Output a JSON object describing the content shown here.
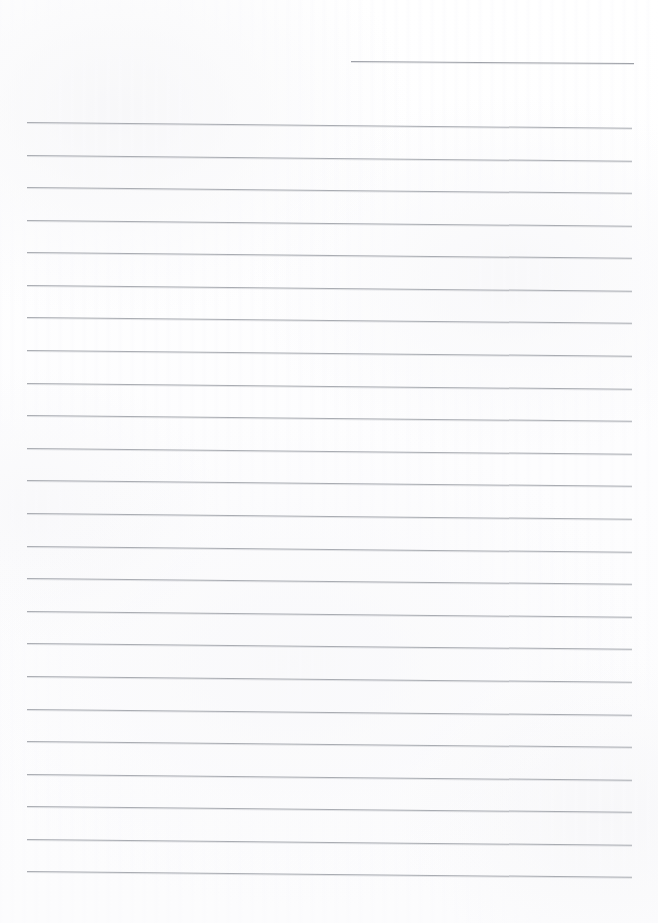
{
  "document": {
    "kind": "scanned-lined-notebook-paper",
    "title": "Blank Ruled Paper Scan",
    "page_width": 658,
    "page_height": 923,
    "visible_text": "",
    "content_note": "No handwriting, no printed text, no headings, no page numbers — the page is blank apart from the ruled guide lines."
  },
  "colors": {
    "page_background": "#fdfdfd",
    "paper_tone": "#fcfcfd",
    "rule_line": "#a9acb2",
    "rule_line_dark": "#9ea1a8",
    "rule_line_soft_edge": "rgba(170,173,180,0.30)"
  },
  "ruling": {
    "line_count": 25,
    "spacing_px": 32.5,
    "stroke_width_px": 1,
    "full_line_left_px": 27,
    "full_line_right_px": 632,
    "full_line_length_px": 605,
    "tilt_deg": 0.55,
    "first_line_is_partial": true,
    "partial_line_left_px": 351,
    "partial_line_right_px": 634,
    "partial_line_length_px": 283,
    "lines": [
      {
        "index": 1,
        "y": 61,
        "left": 351,
        "width": 283,
        "partial": true,
        "tilt": 0.42
      },
      {
        "index": 2,
        "y": 122,
        "left": 27,
        "width": 605,
        "partial": false,
        "tilt": 0.55
      },
      {
        "index": 3,
        "y": 155,
        "left": 27,
        "width": 605,
        "partial": false,
        "tilt": 0.55
      },
      {
        "index": 4,
        "y": 187,
        "left": 27,
        "width": 605,
        "partial": false,
        "tilt": 0.55
      },
      {
        "index": 5,
        "y": 220,
        "left": 27,
        "width": 605,
        "partial": false,
        "tilt": 0.55
      },
      {
        "index": 6,
        "y": 252,
        "left": 27,
        "width": 605,
        "partial": false,
        "tilt": 0.55
      },
      {
        "index": 7,
        "y": 285,
        "left": 27,
        "width": 605,
        "partial": false,
        "tilt": 0.55
      },
      {
        "index": 8,
        "y": 317,
        "left": 27,
        "width": 605,
        "partial": false,
        "tilt": 0.55
      },
      {
        "index": 9,
        "y": 350,
        "left": 27,
        "width": 605,
        "partial": false,
        "tilt": 0.55
      },
      {
        "index": 10,
        "y": 383,
        "left": 27,
        "width": 605,
        "partial": false,
        "tilt": 0.55
      },
      {
        "index": 11,
        "y": 415,
        "left": 27,
        "width": 605,
        "partial": false,
        "tilt": 0.55
      },
      {
        "index": 12,
        "y": 448,
        "left": 27,
        "width": 605,
        "partial": false,
        "tilt": 0.55
      },
      {
        "index": 13,
        "y": 480,
        "left": 27,
        "width": 605,
        "partial": false,
        "tilt": 0.55
      },
      {
        "index": 14,
        "y": 513,
        "left": 27,
        "width": 605,
        "partial": false,
        "tilt": 0.55
      },
      {
        "index": 15,
        "y": 546,
        "left": 27,
        "width": 605,
        "partial": false,
        "tilt": 0.55
      },
      {
        "index": 16,
        "y": 578,
        "left": 27,
        "width": 605,
        "partial": false,
        "tilt": 0.55
      },
      {
        "index": 17,
        "y": 611,
        "left": 27,
        "width": 605,
        "partial": false,
        "tilt": 0.55
      },
      {
        "index": 18,
        "y": 643,
        "left": 27,
        "width": 605,
        "partial": false,
        "tilt": 0.55
      },
      {
        "index": 19,
        "y": 676,
        "left": 27,
        "width": 605,
        "partial": false,
        "tilt": 0.55
      },
      {
        "index": 20,
        "y": 709,
        "left": 27,
        "width": 605,
        "partial": false,
        "tilt": 0.55
      },
      {
        "index": 21,
        "y": 741,
        "left": 27,
        "width": 605,
        "partial": false,
        "tilt": 0.55
      },
      {
        "index": 22,
        "y": 774,
        "left": 27,
        "width": 605,
        "partial": false,
        "tilt": 0.55
      },
      {
        "index": 23,
        "y": 806,
        "left": 27,
        "width": 605,
        "partial": false,
        "tilt": 0.55
      },
      {
        "index": 24,
        "y": 839,
        "left": 27,
        "width": 605,
        "partial": false,
        "tilt": 0.55
      },
      {
        "index": 25,
        "y": 871,
        "left": 27,
        "width": 605,
        "partial": false,
        "tilt": 0.55
      }
    ]
  },
  "margins": {
    "top_blank_px": 61,
    "left_blank_px": 27,
    "right_blank_px": 26,
    "bottom_blank_px": 42
  }
}
